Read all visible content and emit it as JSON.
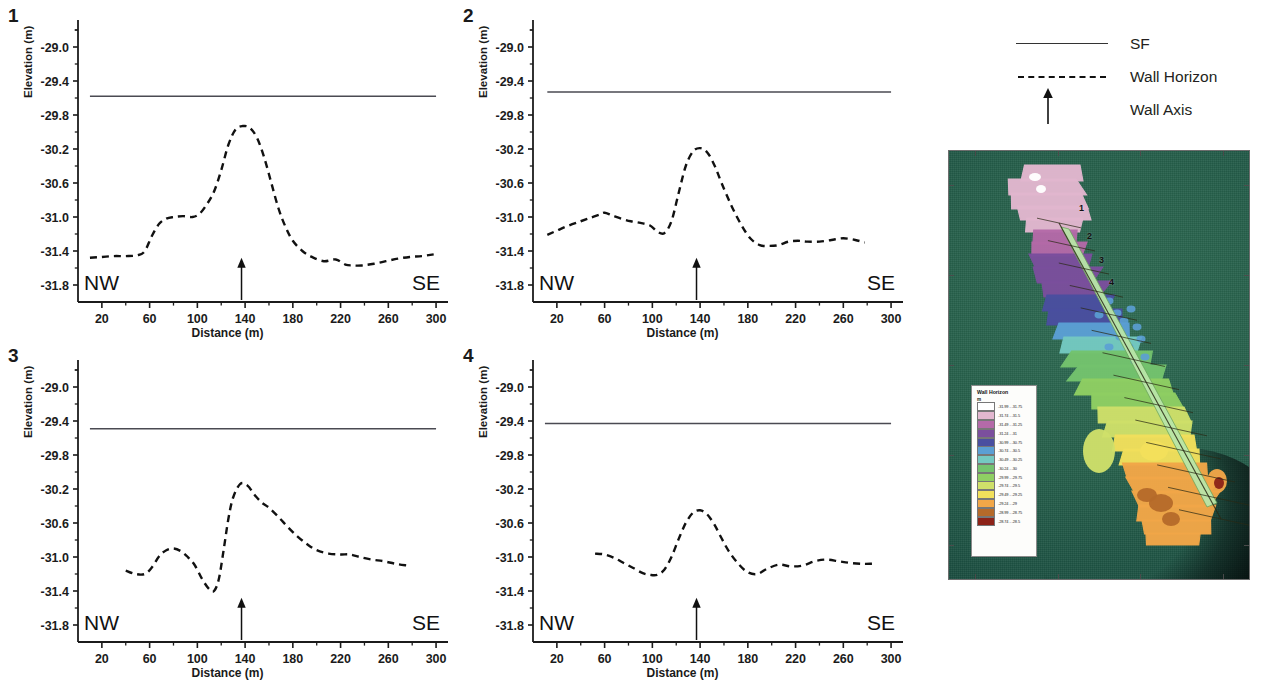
{
  "figure": {
    "legend": {
      "items": [
        {
          "key": "solid-line",
          "label": "SF"
        },
        {
          "key": "dashed-line",
          "label": "Wall Horizon"
        },
        {
          "key": "up-arrow",
          "label": "Wall Axis"
        }
      ]
    }
  },
  "chart_data": [
    {
      "type": "line",
      "panel_label": "1",
      "title": "",
      "xlabel": "Distance (m)",
      "ylabel": "Elevation (m)",
      "xlim": [
        0,
        310
      ],
      "ylim": [
        -32.0,
        -28.8
      ],
      "xticks": [
        20,
        60,
        100,
        140,
        180,
        220,
        260,
        300
      ],
      "yticks": [
        -29.0,
        -29.4,
        -29.8,
        -30.2,
        -30.6,
        -31.0,
        -31.4,
        -31.8
      ],
      "grid": false,
      "left_label": "NW",
      "right_label": "SE",
      "wall_axis_x": 137,
      "sf_value": -29.58,
      "series": [
        {
          "name": "Wall Horizon",
          "style": "dashed",
          "x": [
            10,
            20,
            30,
            40,
            50,
            56,
            62,
            68,
            74,
            80,
            88,
            96,
            102,
            108,
            114,
            120,
            126,
            132,
            138,
            144,
            150,
            156,
            162,
            168,
            174,
            180,
            188,
            196,
            206,
            216,
            224,
            230,
            238,
            248,
            258,
            268,
            278,
            288,
            298
          ],
          "y": [
            -31.48,
            -31.47,
            -31.46,
            -31.46,
            -31.45,
            -31.4,
            -31.22,
            -31.08,
            -31.02,
            -31.0,
            -30.99,
            -31.0,
            -30.96,
            -30.85,
            -30.7,
            -30.45,
            -30.15,
            -29.97,
            -29.93,
            -29.95,
            -30.07,
            -30.3,
            -30.6,
            -30.9,
            -31.12,
            -31.28,
            -31.4,
            -31.47,
            -31.52,
            -31.5,
            -31.56,
            -31.57,
            -31.57,
            -31.55,
            -31.52,
            -31.49,
            -31.47,
            -31.46,
            -31.44
          ]
        },
        {
          "name": "SF",
          "style": "solid",
          "x": [
            10,
            300
          ],
          "y": [
            -29.58,
            -29.58
          ]
        }
      ]
    },
    {
      "type": "line",
      "panel_label": "2",
      "title": "",
      "xlabel": "Distance (m)",
      "ylabel": "Elevation (m)",
      "xlim": [
        0,
        310
      ],
      "ylim": [
        -32.0,
        -28.8
      ],
      "xticks": [
        20,
        60,
        100,
        140,
        180,
        220,
        260,
        300
      ],
      "yticks": [
        -29.0,
        -29.4,
        -29.8,
        -30.2,
        -30.6,
        -31.0,
        -31.4,
        -31.8
      ],
      "grid": false,
      "left_label": "NW",
      "right_label": "SE",
      "wall_axis_x": 137,
      "sf_value": -29.53,
      "series": [
        {
          "name": "Wall Horizon",
          "style": "dashed",
          "x": [
            12,
            20,
            30,
            40,
            48,
            56,
            60,
            66,
            74,
            82,
            90,
            98,
            104,
            110,
            116,
            122,
            128,
            134,
            140,
            146,
            152,
            158,
            166,
            174,
            182,
            190,
            198,
            206,
            214,
            222,
            230,
            240,
            250,
            260,
            270,
            278
          ],
          "y": [
            -31.21,
            -31.16,
            -31.1,
            -31.05,
            -31.01,
            -30.97,
            -30.95,
            -30.98,
            -31.02,
            -31.05,
            -31.07,
            -31.1,
            -31.17,
            -31.19,
            -31.05,
            -30.72,
            -30.4,
            -30.23,
            -30.19,
            -30.24,
            -30.39,
            -30.6,
            -30.86,
            -31.08,
            -31.25,
            -31.33,
            -31.34,
            -31.33,
            -31.29,
            -31.28,
            -31.29,
            -31.29,
            -31.27,
            -31.25,
            -31.27,
            -31.3
          ]
        },
        {
          "name": "SF",
          "style": "solid",
          "x": [
            12,
            300
          ],
          "y": [
            -29.53,
            -29.53
          ]
        }
      ]
    },
    {
      "type": "line",
      "panel_label": "3",
      "title": "",
      "xlabel": "Distance (m)",
      "ylabel": "Elevation (m)",
      "xlim": [
        0,
        310
      ],
      "ylim": [
        -32.0,
        -28.8
      ],
      "xticks": [
        20,
        60,
        100,
        140,
        180,
        220,
        260,
        300
      ],
      "yticks": [
        -29.0,
        -29.4,
        -29.8,
        -30.2,
        -30.6,
        -31.0,
        -31.4,
        -31.8
      ],
      "grid": false,
      "left_label": "NW",
      "right_label": "SE",
      "wall_axis_x": 137,
      "sf_value": -29.49,
      "series": [
        {
          "name": "Wall Horizon",
          "style": "dashed",
          "x": [
            40,
            48,
            56,
            62,
            68,
            74,
            80,
            86,
            92,
            98,
            104,
            110,
            114,
            118,
            122,
            126,
            130,
            136,
            142,
            148,
            154,
            160,
            168,
            176,
            184,
            192,
            200,
            210,
            220,
            228,
            236,
            246,
            256,
            266,
            276
          ],
          "y": [
            -31.16,
            -31.2,
            -31.2,
            -31.12,
            -30.99,
            -30.92,
            -30.9,
            -30.93,
            -31.0,
            -31.1,
            -31.26,
            -31.38,
            -31.4,
            -31.26,
            -30.92,
            -30.55,
            -30.3,
            -30.14,
            -30.16,
            -30.27,
            -30.36,
            -30.42,
            -30.53,
            -30.65,
            -30.76,
            -30.85,
            -30.92,
            -30.96,
            -30.97,
            -30.97,
            -31.0,
            -31.03,
            -31.05,
            -31.08,
            -31.1
          ]
        },
        {
          "name": "SF",
          "style": "solid",
          "x": [
            10,
            300
          ],
          "y": [
            -29.49,
            -29.49
          ]
        }
      ]
    },
    {
      "type": "line",
      "panel_label": "4",
      "title": "",
      "xlabel": "Distance (m)",
      "ylabel": "Elevation (m)",
      "xlim": [
        0,
        310
      ],
      "ylim": [
        -32.0,
        -28.8
      ],
      "xticks": [
        20,
        60,
        100,
        140,
        180,
        220,
        260,
        300
      ],
      "yticks": [
        -29.0,
        -29.4,
        -29.8,
        -30.2,
        -30.6,
        -31.0,
        -31.4,
        -31.8
      ],
      "grid": false,
      "left_label": "NW",
      "right_label": "SE",
      "wall_axis_x": 137,
      "sf_value": -29.43,
      "series": [
        {
          "name": "Wall Horizon",
          "style": "dashed",
          "x": [
            52,
            60,
            68,
            76,
            84,
            92,
            98,
            104,
            110,
            116,
            122,
            128,
            134,
            140,
            146,
            152,
            158,
            164,
            172,
            180,
            188,
            196,
            206,
            216,
            226,
            236,
            246,
            256,
            266,
            276,
            284
          ],
          "y": [
            -30.96,
            -30.97,
            -31.01,
            -31.07,
            -31.13,
            -31.19,
            -31.21,
            -31.21,
            -31.15,
            -31.0,
            -30.79,
            -30.6,
            -30.48,
            -30.45,
            -30.5,
            -30.62,
            -30.78,
            -30.93,
            -31.08,
            -31.18,
            -31.2,
            -31.14,
            -31.09,
            -31.11,
            -31.1,
            -31.05,
            -31.03,
            -31.05,
            -31.07,
            -31.08,
            -31.08
          ]
        },
        {
          "name": "SF",
          "style": "solid",
          "x": [
            10,
            300
          ],
          "y": [
            -29.43,
            -29.43
          ]
        }
      ]
    }
  ],
  "map": {
    "transect_labels": [
      "1",
      "2",
      "3",
      "4"
    ],
    "axis_labels": {
      "top": [
        "233000",
        "233500",
        "234000",
        "234500"
      ],
      "bottom": [
        "233000",
        "233500",
        "234000",
        "234500"
      ],
      "left": [
        "4417500",
        "4417000",
        "4416500",
        "4416000",
        "4415500"
      ],
      "right": [
        "4417500",
        "4417000",
        "4416500",
        "4416000",
        "4415500"
      ]
    },
    "legend": {
      "title": "Wall Horizon",
      "unit": "m",
      "classes": [
        {
          "color": "#ffffff",
          "range": "-31.99 - -31.75"
        },
        {
          "color": "#e2b7cf",
          "range": "-31.74 - -31.5"
        },
        {
          "color": "#b46aa8",
          "range": "-31.49 - -31.25"
        },
        {
          "color": "#7b4f9d",
          "range": "-31.24 - -31"
        },
        {
          "color": "#4a4fa0",
          "range": "-30.99 - -30.75"
        },
        {
          "color": "#5b9fd4",
          "range": "-30.74 - -30.5"
        },
        {
          "color": "#74c9c1",
          "range": "-30.49 - -30.25"
        },
        {
          "color": "#74c36e",
          "range": "-30.24 - -30"
        },
        {
          "color": "#8fcf63",
          "range": "-29.99 - -29.75"
        },
        {
          "color": "#cfe06a",
          "range": "-29.74 - -29.5"
        },
        {
          "color": "#f2e05c",
          "range": "-29.49 - -29.25"
        },
        {
          "color": "#f2a748",
          "range": "-29.24 - -29"
        },
        {
          "color": "#b56a2a",
          "range": "-28.99 - -28.75"
        },
        {
          "color": "#8d2318",
          "range": "-28.74 - -28.5"
        }
      ]
    }
  }
}
